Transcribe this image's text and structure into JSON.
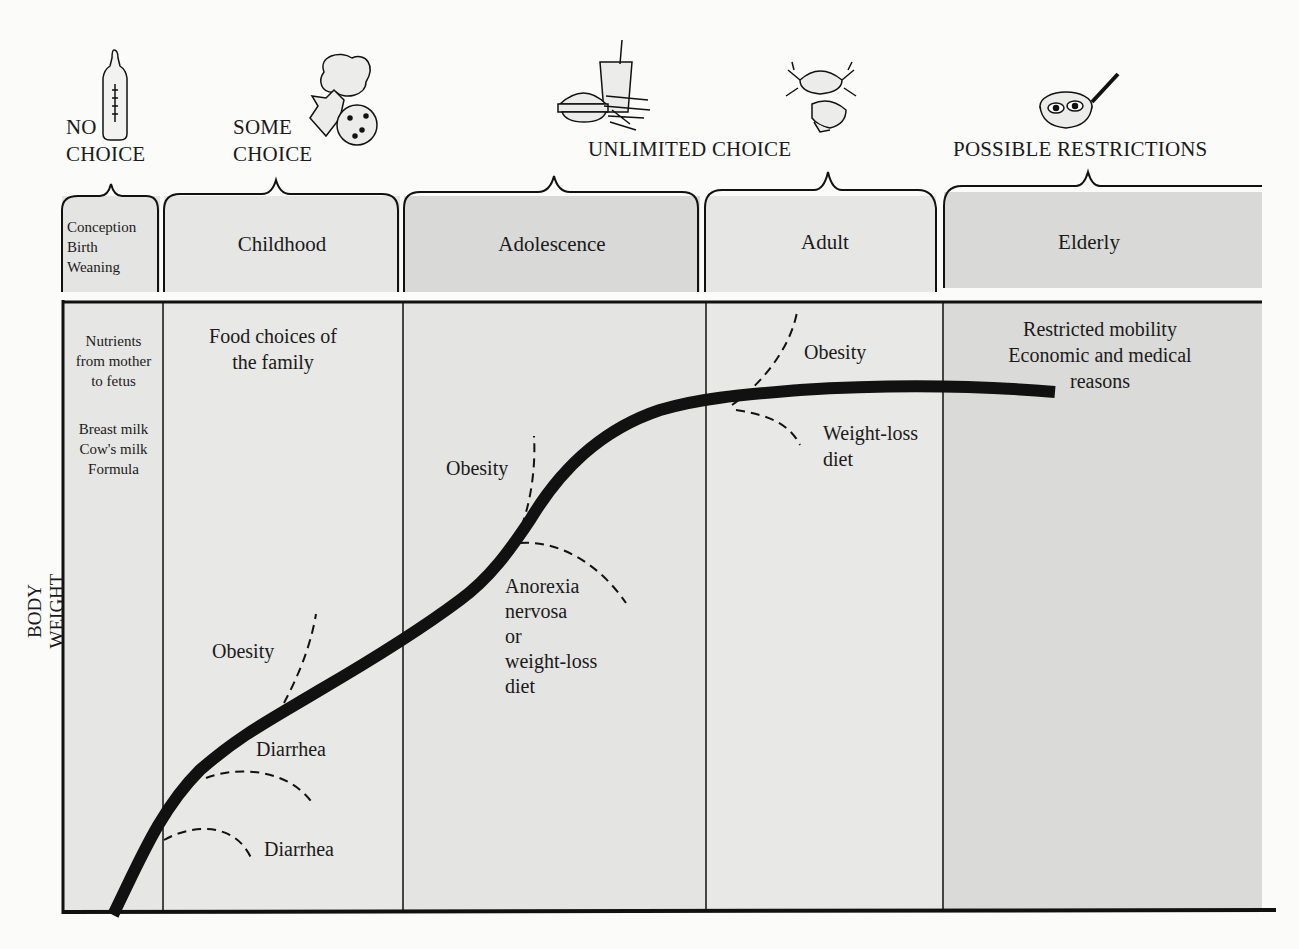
{
  "header": {
    "title_partial": "AMOUNT OF CHOICE"
  },
  "choice_levels": [
    {
      "label_line1": "NO",
      "label_line2": "CHOICE",
      "icon": "baby-bottle-icon"
    },
    {
      "label_line1": "SOME",
      "label_line2": "CHOICE",
      "icon": "cookies-icon"
    },
    {
      "label": "UNLIMITED CHOICE",
      "icons": [
        "burger-fries-drink-icon",
        "crab-shrimp-icon"
      ]
    },
    {
      "label": "POSSIBLE RESTRICTIONS",
      "icon": "frying-pan-eggs-icon"
    }
  ],
  "stages": [
    {
      "label_lines": [
        "Conception",
        "Birth",
        "Weaning"
      ]
    },
    {
      "label": "Childhood"
    },
    {
      "label": "Adolescence"
    },
    {
      "label": "Adult"
    },
    {
      "label": "Elderly"
    }
  ],
  "panel_notes": {
    "infancy": {
      "lines1": [
        "Nutrients",
        "from mother",
        "to fetus"
      ],
      "lines2": [
        "Breast milk",
        "Cow's milk",
        "Formula"
      ]
    },
    "childhood": {
      "lines": [
        "Food choices of",
        "the family"
      ]
    },
    "elderly": {
      "lines": [
        "Restricted mobility",
        "Economic and medical",
        "reasons"
      ]
    }
  },
  "curve_annotations": {
    "childhood_obesity": "Obesity",
    "childhood_diarrhea_upper": "Diarrhea",
    "childhood_diarrhea_lower": "Diarrhea",
    "adolescence_obesity": "Obesity",
    "adolescence_anorexia": [
      "Anorexia",
      "nervosa",
      "or",
      "weight-loss",
      "diet"
    ],
    "adult_obesity": "Obesity",
    "adult_weightloss": [
      "Weight-loss",
      "diet"
    ]
  },
  "axis": {
    "ylabel": "BODY WEIGHT"
  },
  "footer": {
    "figure_label_partial": "FIGURE 1.2"
  },
  "colors": {
    "light_panel": "#e8e8e6",
    "dark_panel": "#dadad8",
    "ink": "#111111"
  }
}
